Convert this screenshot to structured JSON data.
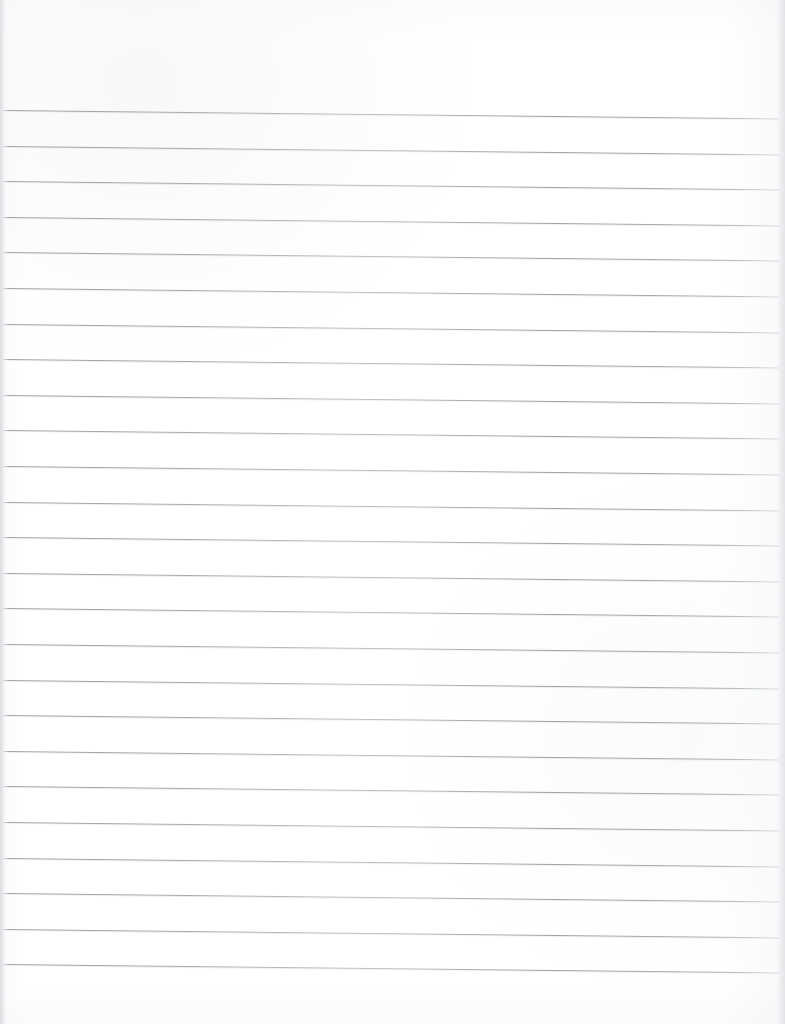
{
  "document": {
    "kind": "scanned-lined-paper",
    "title": "Blank lined notebook paper",
    "page_width": 785,
    "page_height": 1024,
    "background_color": "#ffffff",
    "content_text": "",
    "is_blank": true
  },
  "ruling": {
    "line_color": "#9aa0a8",
    "line_count": 25,
    "first_line_y": 110,
    "line_spacing": 35.6,
    "line_thickness": 1,
    "line_start_x": 3,
    "line_end_x": 779,
    "skew_degrees": 0.62,
    "top_margin": 110,
    "bottom_margin": 50,
    "left_margin": 3,
    "right_margin": 6
  },
  "scan": {
    "left_edge_shadow_color": "#d6d8dc",
    "right_edge_shadow_color": "#dddfe3",
    "paper_tone": "#fdfdfe"
  },
  "lines": [
    {
      "index": 1,
      "y": 110.0,
      "skew": 0.62
    },
    {
      "index": 2,
      "y": 145.6,
      "skew": 0.62
    },
    {
      "index": 3,
      "y": 181.2,
      "skew": 0.62
    },
    {
      "index": 4,
      "y": 216.8,
      "skew": 0.62
    },
    {
      "index": 5,
      "y": 252.4,
      "skew": 0.62
    },
    {
      "index": 6,
      "y": 288.0,
      "skew": 0.62
    },
    {
      "index": 7,
      "y": 323.6,
      "skew": 0.62
    },
    {
      "index": 8,
      "y": 359.2,
      "skew": 0.62
    },
    {
      "index": 9,
      "y": 394.8,
      "skew": 0.62
    },
    {
      "index": 10,
      "y": 430.4,
      "skew": 0.62
    },
    {
      "index": 11,
      "y": 466.0,
      "skew": 0.62
    },
    {
      "index": 12,
      "y": 501.6,
      "skew": 0.62
    },
    {
      "index": 13,
      "y": 537.2,
      "skew": 0.62
    },
    {
      "index": 14,
      "y": 572.8,
      "skew": 0.62
    },
    {
      "index": 15,
      "y": 608.4,
      "skew": 0.62
    },
    {
      "index": 16,
      "y": 644.0,
      "skew": 0.62
    },
    {
      "index": 17,
      "y": 679.6,
      "skew": 0.62
    },
    {
      "index": 18,
      "y": 715.2,
      "skew": 0.62
    },
    {
      "index": 19,
      "y": 750.8,
      "skew": 0.62
    },
    {
      "index": 20,
      "y": 786.4,
      "skew": 0.62
    },
    {
      "index": 21,
      "y": 822.0,
      "skew": 0.62
    },
    {
      "index": 22,
      "y": 857.6,
      "skew": 0.62
    },
    {
      "index": 23,
      "y": 893.2,
      "skew": 0.62
    },
    {
      "index": 24,
      "y": 928.8,
      "skew": 0.62
    },
    {
      "index": 25,
      "y": 964.4,
      "skew": 0.62
    }
  ]
}
